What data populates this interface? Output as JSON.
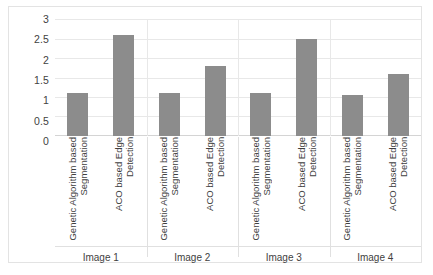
{
  "chart_data": {
    "type": "bar",
    "title": "",
    "xlabel": "",
    "ylabel": "",
    "ylim": [
      0,
      3
    ],
    "yticks": [
      "0",
      "0.5",
      "1",
      "1.5",
      "2",
      "2.5",
      "3"
    ],
    "grid": true,
    "legend": "none",
    "categories": [
      "Image 1",
      "Image 2",
      "Image 3",
      "Image 4"
    ],
    "series": [
      {
        "name": "Genetic Algorithm based Segmentation",
        "values": [
          1.1,
          1.1,
          1.1,
          1.05
        ]
      },
      {
        "name": "ACO based Edge Detection",
        "values": [
          2.6,
          1.8,
          2.5,
          1.6
        ]
      }
    ],
    "bar_color": "#8c8c8c",
    "grid_color": "#e8e8e8",
    "border_color": "#e3e3e3"
  },
  "series_labels": [
    "Genetic Algorithm based\nSegmentation",
    "ACO based Edge\nDetection"
  ]
}
